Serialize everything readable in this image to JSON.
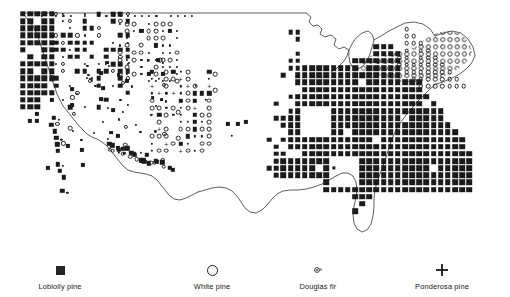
{
  "figure": {
    "background_color": "#ffffff",
    "ink_color": "#1b1b1b",
    "outline_color": "#5a5a5a"
  },
  "map": {
    "region": "Conterminous United States",
    "outline_name": "us-boundary-outline",
    "grid": {
      "cols": 64,
      "rows": 40,
      "cell_px": 7.2,
      "origin_x": 22,
      "origin_y": 12
    }
  },
  "legend": {
    "items": [
      {
        "label": "Loblolly pine",
        "symbol": "filled-square",
        "x": 60,
        "color": "#262626"
      },
      {
        "label": "White pine",
        "symbol": "open-circle",
        "x": 212,
        "color": "#1f1f1f"
      },
      {
        "label": "Douglas fir",
        "symbol": "stipple-mark",
        "x": 318,
        "color": "#3a3a3a"
      },
      {
        "label": "Ponderosa pine",
        "symbol": "plus-sign",
        "x": 442,
        "color": "#141414"
      }
    ]
  },
  "chart_data": {
    "type": "map",
    "xlabel": "",
    "ylabel": "",
    "legend_position": "bottom",
    "grid": true,
    "series": [
      {
        "name": "Loblolly pine",
        "symbol": "filled-square",
        "region": "eastern United States"
      },
      {
        "name": "White pine",
        "symbol": "open-circle",
        "region": "northeast and northern Rockies"
      },
      {
        "name": "Douglas fir",
        "symbol": "stipple-mark",
        "region": "Pacific Northwest and Rockies"
      },
      {
        "name": "Ponderosa pine",
        "symbol": "plus-sign",
        "region": "interior West"
      }
    ],
    "east_squares": "201001,201101,201201,201301,191002,191102,201002,201102,201202,201302,201402,181003,191003,201003,211003,221003,231003,241003"
  },
  "symbols": {
    "west": [
      {
        "t": "s",
        "x": 24,
        "y": 14,
        "w": 5
      },
      {
        "t": "s",
        "x": 30,
        "y": 14,
        "w": 5
      },
      {
        "t": "s",
        "x": 36,
        "y": 14,
        "w": 4
      },
      {
        "t": "s",
        "x": 42,
        "y": 14,
        "w": 5
      },
      {
        "t": "s",
        "x": 48,
        "y": 14,
        "w": 4
      },
      {
        "t": "d",
        "x": 54,
        "y": 14,
        "w": 2
      },
      {
        "t": "d",
        "x": 60,
        "y": 14,
        "w": 2
      },
      {
        "t": "d",
        "x": 66,
        "y": 14,
        "w": 2
      },
      {
        "t": "d",
        "x": 72,
        "y": 14,
        "w": 2
      },
      {
        "t": "d",
        "x": 78,
        "y": 14,
        "w": 2
      },
      {
        "t": "d",
        "x": 84,
        "y": 14,
        "w": 2
      },
      {
        "t": "d",
        "x": 90,
        "y": 14,
        "w": 2
      },
      {
        "t": "d",
        "x": 96,
        "y": 14,
        "w": 2
      },
      {
        "t": "d",
        "x": 102,
        "y": 14,
        "w": 2
      },
      {
        "t": "d",
        "x": 108,
        "y": 14,
        "w": 2
      },
      {
        "t": "d",
        "x": 114,
        "y": 14,
        "w": 2
      },
      {
        "t": "s",
        "x": 24,
        "y": 20,
        "w": 5
      },
      {
        "t": "s",
        "x": 30,
        "y": 20,
        "w": 5
      },
      {
        "t": "s",
        "x": 36,
        "y": 20,
        "w": 5
      },
      {
        "t": "s",
        "x": 42,
        "y": 20,
        "w": 5
      },
      {
        "t": "s",
        "x": 48,
        "y": 20,
        "w": 4
      },
      {
        "t": "s",
        "x": 60,
        "y": 20,
        "w": 4
      },
      {
        "t": "s",
        "x": 66,
        "y": 20,
        "w": 4
      },
      {
        "t": "s",
        "x": 72,
        "y": 20,
        "w": 4
      },
      {
        "t": "s",
        "x": 78,
        "y": 20,
        "w": 5
      },
      {
        "t": "s",
        "x": 84,
        "y": 20,
        "w": 5
      },
      {
        "t": "s",
        "x": 90,
        "y": 20,
        "w": 4
      },
      {
        "t": "o",
        "x": 96,
        "y": 20,
        "r": 3
      },
      {
        "t": "o",
        "x": 102,
        "y": 20,
        "r": 3
      },
      {
        "t": "o",
        "x": 108,
        "y": 20,
        "r": 3
      },
      {
        "t": "d",
        "x": 114,
        "y": 20,
        "w": 2
      },
      {
        "t": "d",
        "x": 120,
        "y": 20,
        "w": 2
      }
    ]
  }
}
